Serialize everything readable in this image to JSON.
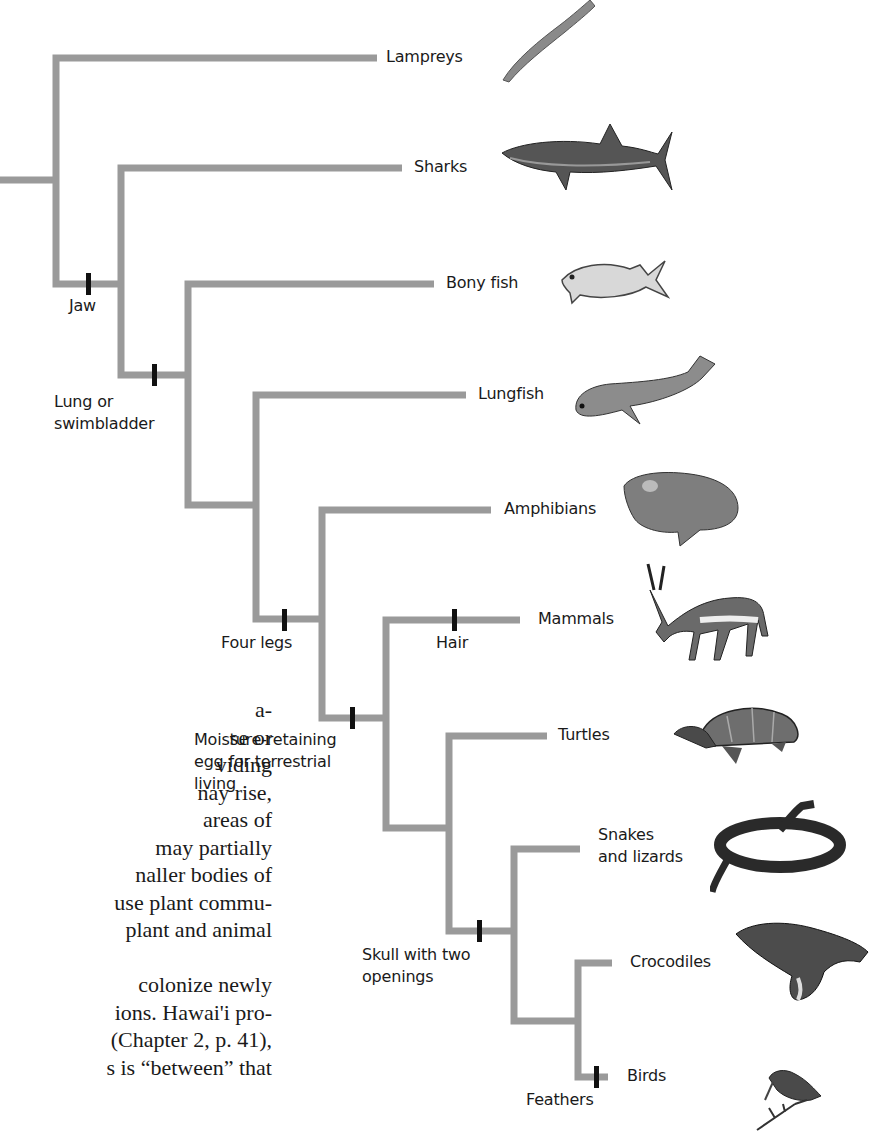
{
  "figure": {
    "line_color": "#9a9a9a",
    "marker_color": "#111111",
    "taxa": [
      {
        "id": "lampreys",
        "label": "Lampreys"
      },
      {
        "id": "sharks",
        "label": "Sharks"
      },
      {
        "id": "bony_fish",
        "label": "Bony fish"
      },
      {
        "id": "lungfish",
        "label": "Lungfish"
      },
      {
        "id": "amphibians",
        "label": "Amphibians"
      },
      {
        "id": "mammals",
        "label": "Mammals"
      },
      {
        "id": "turtles",
        "label": "Turtles"
      },
      {
        "id": "snakes_lizards",
        "label_line1": "Snakes",
        "label_line2": "and lizards"
      },
      {
        "id": "crocodiles",
        "label": "Crocodiles"
      },
      {
        "id": "birds",
        "label": "Birds"
      }
    ],
    "traits": [
      {
        "id": "jaw",
        "label": "Jaw"
      },
      {
        "id": "lung",
        "label_line1": "Lung or",
        "label_line2": "swimbladder"
      },
      {
        "id": "four_legs",
        "label": "Four legs"
      },
      {
        "id": "hair",
        "label": "Hair"
      },
      {
        "id": "egg",
        "label_line1": "Moisture-retaining",
        "label_line2": "egg for terrestrial",
        "label_line3": "living"
      },
      {
        "id": "skull",
        "label_line1": "Skull with two",
        "label_line2": "openings"
      },
      {
        "id": "feathers",
        "label": "Feathers"
      }
    ],
    "illustrations": [
      "lamprey-illustration",
      "shark-illustration",
      "bony-fish-illustration",
      "lungfish-illustration",
      "frog-illustration",
      "gazelle-illustration",
      "turtle-illustration",
      "snake-illustration",
      "crocodile-illustration",
      "bird-illustration"
    ]
  },
  "body_text": {
    "lines": [
      "a-",
      "se or",
      "viding",
      "nay  rise,",
      " areas  of",
      "may partially",
      "naller bodies of",
      "use plant commu-",
      " plant  and  animal",
      "",
      " colonize   newly",
      "ions. Hawai'i pro-",
      "(Chapter 2, p. 41),",
      "s   is  “between”  that"
    ]
  }
}
